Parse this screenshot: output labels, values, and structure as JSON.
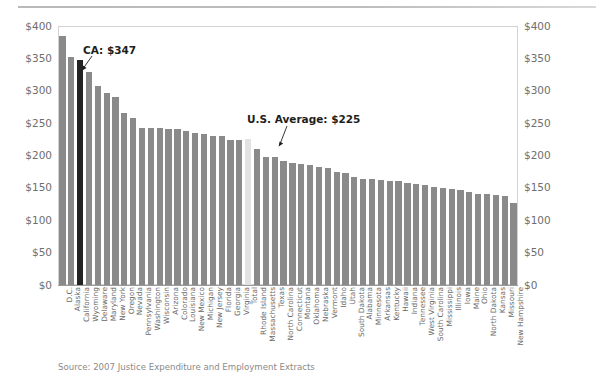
{
  "figure": {
    "source_note": "Source: 2007 Justice Expenditure and Employment Extracts",
    "colors": {
      "bar": "#8a8a8a",
      "highlight_dark": "#232323",
      "highlight_light": "#e2e2e2",
      "frame": "#d2d2d2",
      "text": "#6a6a6a"
    }
  },
  "annotations": [
    {
      "name": "ca-annotation",
      "label": "CA: $347",
      "target_category": "California"
    },
    {
      "name": "us-average-annotation",
      "label": "U.S. Average: $225",
      "target_category": "Total"
    }
  ],
  "chart_data": {
    "type": "bar",
    "title": "",
    "subtitle": "",
    "xlabel": "",
    "ylabel": "",
    "ylim": [
      0,
      400
    ],
    "yticks": [
      0,
      50,
      100,
      150,
      200,
      250,
      300,
      350,
      400
    ],
    "ytick_labels": [
      "$0",
      "$50",
      "$100",
      "$150",
      "$200",
      "$250",
      "$300",
      "$350",
      "$400"
    ],
    "ytick_labels_right": [
      "$0",
      "$50",
      "$100",
      "$150",
      "$200",
      "$250",
      "$300",
      "$350",
      "$400"
    ],
    "grid": false,
    "legend": "none",
    "categories": [
      "D.C.",
      "Alaska",
      "California",
      "Wyoming",
      "Delaware",
      "Maryland",
      "New York",
      "Oregon",
      "Nevada",
      "Pennsylvania",
      "Washington",
      "Wisconsin",
      "Arizona",
      "Colorado",
      "Louisiana",
      "New Mexico",
      "Michigan",
      "New Jersey",
      "Florida",
      "Georgia",
      "Virginia",
      "Total",
      "Rhode Island",
      "Massachusetts",
      "Texas",
      "North Carolina",
      "Connecticut",
      "Montana",
      "Oklahoma",
      "Nebraska",
      "Vermont",
      "Idaho",
      "Utah",
      "South Dakota",
      "Alabama",
      "Minnesota",
      "Arkansas",
      "Kentucky",
      "Hawaii",
      "Indiana",
      "Tennessee",
      "West Virginia",
      "South Carolina",
      "Mississippi",
      "Illinois",
      "Iowa",
      "Maine",
      "Ohio",
      "North Dakota",
      "Kansas",
      "Missouri",
      "New Hampshire"
    ],
    "values": [
      385,
      352,
      347,
      329,
      308,
      296,
      291,
      265,
      258,
      243,
      242,
      242,
      241,
      241,
      238,
      235,
      234,
      230,
      230,
      224,
      224,
      225,
      210,
      198,
      197,
      191,
      188,
      187,
      186,
      183,
      180,
      175,
      173,
      167,
      164,
      163,
      162,
      160,
      160,
      157,
      156,
      154,
      152,
      150,
      148,
      147,
      143,
      141,
      140,
      139,
      138,
      127
    ],
    "bar_styles": {
      "California": "highlight-dark",
      "Total": "highlight-light"
    }
  }
}
